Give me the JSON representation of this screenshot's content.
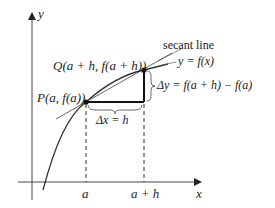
{
  "diagram": {
    "axes": {
      "x_label": "x",
      "y_label": "y"
    },
    "points": {
      "P": {
        "label": "P(a, f(a))"
      },
      "Q": {
        "label": "Q(a + h, f(a + h))"
      }
    },
    "annotations": {
      "secant": "secant line",
      "curve": "y = f(x)",
      "delta_y": "Δy = f(a + h) − f(a)",
      "delta_x": "Δx = h"
    },
    "ticks": {
      "a": "a",
      "a_plus_h": "a + h"
    },
    "colors": {
      "ink": "#222222",
      "curve": "#333333",
      "secant": "#555555",
      "background": "#ffffff"
    }
  }
}
